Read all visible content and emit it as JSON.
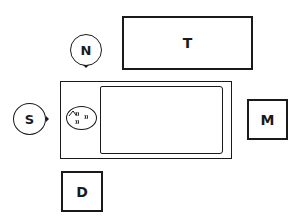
{
  "diagram": {
    "type": "room-layout",
    "labels": {
      "table_t": "T",
      "table_m": "M",
      "table_d": "D",
      "person_n": "N",
      "person_s": "S"
    },
    "patient": {
      "head_marks": [
        "(!",
        "(!",
        ")"
      ]
    },
    "colors": {
      "line": "#1a1a1a",
      "background": "#ffffff"
    }
  }
}
